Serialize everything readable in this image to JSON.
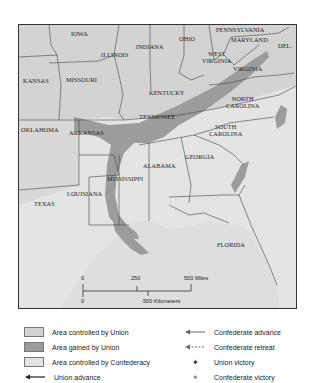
{
  "map": {
    "colors": {
      "union": "#d3d3d3",
      "gained": "#9c9c9c",
      "confederacy": "#e4e4e4",
      "water": "#dedede",
      "border": "#333333"
    },
    "states": [
      {
        "id": "iowa",
        "label": "IOWA"
      },
      {
        "id": "illinois",
        "label": "ILLINOIS"
      },
      {
        "id": "indiana",
        "label": "INDIANA"
      },
      {
        "id": "ohio",
        "label": "OHIO"
      },
      {
        "id": "pennsylvania",
        "label": "PENNSYLVANIA"
      },
      {
        "id": "maryland",
        "label": "MARYLAND"
      },
      {
        "id": "delaware",
        "label": "DEL."
      },
      {
        "id": "west-virginia",
        "label": "WEST\nVIRGINIA"
      },
      {
        "id": "virginia",
        "label": "VIRGINIA"
      },
      {
        "id": "kansas",
        "label": "KANSAS"
      },
      {
        "id": "missouri",
        "label": "MISSOURI"
      },
      {
        "id": "kentucky",
        "label": "KENTUCKY"
      },
      {
        "id": "north-carolina",
        "label": "NORTH\nCAROLINA"
      },
      {
        "id": "tennessee",
        "label": "TENNESSEE"
      },
      {
        "id": "oklahoma",
        "label": "OKLAHOMA"
      },
      {
        "id": "arkansas",
        "label": "ARKANSAS"
      },
      {
        "id": "south-carolina",
        "label": "SOUTH\nCAROLINA"
      },
      {
        "id": "georgia",
        "label": "GEORGIA"
      },
      {
        "id": "alabama",
        "label": "ALABAMA"
      },
      {
        "id": "mississippi",
        "label": "MISSISSIPPI"
      },
      {
        "id": "louisiana",
        "label": "LOUISIANA"
      },
      {
        "id": "texas",
        "label": "TEXAS"
      },
      {
        "id": "florida",
        "label": "FLORIDA"
      }
    ],
    "scale": {
      "miles_ticks": [
        "0",
        "250",
        "500 Miles"
      ],
      "km_ticks": [
        "0",
        "500 Kilometers"
      ]
    }
  },
  "legend": {
    "items": [
      {
        "label": "Area controlled by Union",
        "type": "swatch",
        "key": "union"
      },
      {
        "label": "Area gained by Union",
        "type": "swatch",
        "key": "gained"
      },
      {
        "label": "Area controlled by Confederacy",
        "type": "swatch",
        "key": "confederacy"
      },
      {
        "label": "Union advance",
        "type": "arrow-solid",
        "icon": "union-advance-arrow-icon"
      },
      {
        "label": "Confederate advance",
        "type": "arrow-solid",
        "icon": "confederate-advance-arrow-icon"
      },
      {
        "label": "Confederate retreat",
        "type": "arrow-dashed",
        "icon": "confederate-retreat-arrow-icon"
      },
      {
        "label": "Union victory",
        "type": "star",
        "icon": "union-victory-icon"
      },
      {
        "label": "Confederate victory",
        "type": "star-light",
        "icon": "confederate-victory-icon"
      }
    ]
  }
}
